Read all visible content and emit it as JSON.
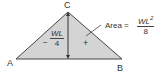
{
  "diagram": {
    "type": "moment-diagram-triangle",
    "vertices": {
      "A": "A",
      "B": "B",
      "C": "C"
    },
    "left_value": {
      "sign": "−",
      "numerator": "WL",
      "denominator": "4"
    },
    "area_label": {
      "prefix": "Area =",
      "numerator": "WL",
      "exponent": "2",
      "denominator": "8"
    },
    "plus_sign": "+",
    "colors": {
      "fill": "#d4d4d4",
      "stroke": "#444444"
    }
  }
}
